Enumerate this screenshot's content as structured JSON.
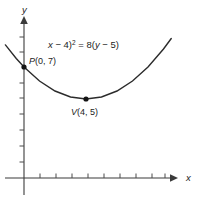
{
  "figure": {
    "title_equation": "(x − 4)² = 8(y − 5)",
    "equation_parts": {
      "x_var": "x",
      "open_paren": "(",
      "minus_h": " − 4)",
      "exponent": "2",
      "equals": " = 8(",
      "y_var": "y",
      "minus_k": " − 5)"
    },
    "background_color": "#ffffff",
    "stroke_color": "#2b2b2b",
    "axis_color": "#3b3b3b"
  },
  "axes": {
    "x_axis_label": "x",
    "y_axis_label": "y",
    "x_tick_count": 9,
    "y_tick_count": 8,
    "origin_px": [
      24,
      178
    ],
    "x_axis_extent_px": [
      5,
      172
    ],
    "y_axis_extent_px": [
      20,
      195
    ]
  },
  "points": [
    {
      "name": "P",
      "label": "P(0, 7)",
      "label_name": "P",
      "label_coords": "(0, 7)",
      "x": 0,
      "y": 7,
      "px": [
        24,
        67
      ]
    },
    {
      "name": "V",
      "label": "V(4, 5)",
      "label_name": "V",
      "label_coords": "(4, 5)",
      "x": 4,
      "y": 5,
      "px": [
        86,
        99
      ]
    }
  ],
  "chart_data": {
    "type": "line",
    "xlabel": "x",
    "ylabel": "y",
    "grid": false,
    "legend": "none",
    "curve_name": "parabola",
    "equation": "(x - 4)^2 = 8(y - 5)",
    "vertex": [
      4,
      5
    ],
    "focal_parameter_4p": 8,
    "opens": "up",
    "xlim": [
      -1.2,
      9.5
    ],
    "ylim": [
      0,
      12
    ],
    "x": [
      -1.2,
      -0.5,
      0,
      1,
      2,
      3,
      4,
      5,
      6,
      7,
      8,
      9,
      9.5
    ],
    "y": [
      8.38,
      7.53,
      7,
      6.125,
      5.5,
      5.125,
      5,
      5.125,
      5.5,
      6.125,
      7,
      8.125,
      8.78
    ],
    "annotations": [
      {
        "text": "P(0, 7)",
        "x": 0,
        "y": 7
      },
      {
        "text": "V(4, 5)",
        "x": 4,
        "y": 5
      },
      {
        "text": "(x − 4)² = 8(y − 5)",
        "x": 4.2,
        "y": 11.1
      }
    ]
  }
}
